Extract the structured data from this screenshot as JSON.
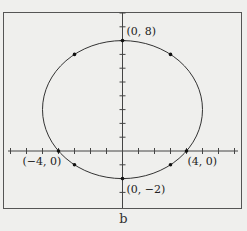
{
  "figure": {
    "caption": "b",
    "equation": "x^2 + (y - 3)^2 = 25",
    "center": [
      0,
      3
    ],
    "radius": 5,
    "points": [
      {
        "x": 0,
        "y": 8,
        "label": "(0, 8)"
      },
      {
        "x": 0,
        "y": -2,
        "label": "(0, −2)"
      },
      {
        "x": -4,
        "y": 0,
        "label": "(−4, 0)"
      },
      {
        "x": 4,
        "y": 0,
        "label": "(4, 0)"
      },
      {
        "x": -3,
        "y": 7,
        "label": ""
      },
      {
        "x": 3,
        "y": 7,
        "label": ""
      },
      {
        "x": -3,
        "y": -1,
        "label": ""
      },
      {
        "x": 3,
        "y": -1,
        "label": ""
      }
    ],
    "x_ticks": [
      -7,
      -6,
      -5,
      -4,
      -3,
      -2,
      -1,
      1,
      2,
      3,
      4,
      5,
      6,
      7
    ],
    "y_ticks": [
      -3,
      -2,
      -1,
      1,
      2,
      3,
      4,
      5,
      6,
      7,
      8,
      9,
      10
    ],
    "colors": {
      "curve": "#333333",
      "frame": "#555555",
      "axis": "#444444"
    }
  }
}
